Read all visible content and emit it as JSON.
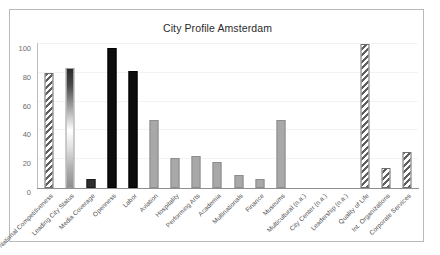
{
  "chart_data": {
    "type": "bar",
    "title": "City Profile Amsterdam",
    "xlabel": "",
    "ylabel": "",
    "ylim": [
      0,
      100
    ],
    "yticks": [
      0,
      20,
      40,
      60,
      80,
      100
    ],
    "grid": true,
    "legend": false,
    "categories": [
      "National Competitiveness",
      "Leading City Status",
      "Media Coverage",
      "Openness",
      "Labor",
      "Aviation",
      "Hospitality",
      "Performing Arts",
      "Academia",
      "Multinationals",
      "Finance",
      "Museums",
      "Multicultural (n.a.)",
      "City Center (n.a.)",
      "Leadership (n.a.)",
      "Quality of Life",
      "Int. Organizations",
      "Corporate Services"
    ],
    "values": [
      80,
      83,
      6.5,
      97,
      81,
      47,
      21,
      22,
      18,
      9,
      6,
      47.5,
      0,
      0,
      0,
      100,
      14,
      25
    ],
    "bar_styles": [
      "hatch",
      "gradient",
      "solid-dark",
      "solid-black",
      "solid-black",
      "solid-grey",
      "solid-grey",
      "solid-grey",
      "solid-grey",
      "solid-grey",
      "solid-grey",
      "solid-grey",
      "solid-grey",
      "solid-grey",
      "solid-grey",
      "hatch",
      "hatch",
      "hatch"
    ],
    "colors": {
      "grey": "#a8a8a8",
      "dark": "#2e2e2e",
      "black": "#0d0d0d",
      "hatch": "#5f5f5f",
      "grid": "#f3f3f3",
      "axis": "#8f8f8f",
      "frame": "#b9b9b9",
      "title_text": "#2b2b2b",
      "tick_text": "#6d6d6d",
      "label_text": "#4f4f4f"
    }
  }
}
